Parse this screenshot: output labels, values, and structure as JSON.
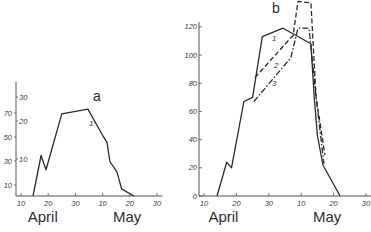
{
  "colors": {
    "ink": "#2b2b2b",
    "axis": "#555555",
    "background": "#ffffff"
  },
  "chart_data": [
    {
      "panel": "a",
      "type": "line",
      "title": "a",
      "xlabel": "",
      "ylabel": "",
      "x_unit": "day counted from April 1 (April 10 = 10, May 10 = 40)",
      "x_ticks": [
        {
          "day": 10,
          "label": "10"
        },
        {
          "day": 20,
          "label": "20"
        },
        {
          "day": 30,
          "label": "30"
        },
        {
          "day": 40,
          "label": "10"
        },
        {
          "day": 50,
          "label": "20"
        },
        {
          "day": 60,
          "label": "30"
        }
      ],
      "month_labels": [
        {
          "label": "April",
          "day": 18
        },
        {
          "label": "May",
          "day": 49
        }
      ],
      "y_ticks_outer": [
        "10",
        "30",
        "50",
        "70"
      ],
      "y_ticks_inner": [
        "10",
        "20",
        "30"
      ],
      "ylim": [
        0,
        80
      ],
      "grid": false,
      "series": [
        {
          "name": "1",
          "style": "solid",
          "points": [
            [
              14.4,
              0
            ],
            [
              17.4,
              34
            ],
            [
              19.2,
              22
            ],
            [
              25,
              69
            ],
            [
              34.6,
              73
            ],
            [
              40,
              51
            ],
            [
              41.6,
              45
            ],
            [
              42.7,
              29
            ],
            [
              45.3,
              20
            ],
            [
              47,
              6
            ],
            [
              51.5,
              0
            ]
          ]
        }
      ]
    },
    {
      "panel": "b",
      "type": "line",
      "title": "b",
      "xlabel": "",
      "ylabel": "",
      "x_unit": "day counted from April 1 (April 10 = 10, May 10 = 40)",
      "x_ticks": [
        {
          "day": 10,
          "label": "10"
        },
        {
          "day": 20,
          "label": "20"
        },
        {
          "day": 30,
          "label": "30"
        },
        {
          "day": 40,
          "label": "10"
        },
        {
          "day": 50,
          "label": "20"
        },
        {
          "day": 60,
          "label": "30"
        }
      ],
      "month_labels": [
        {
          "label": "April",
          "day": 16
        },
        {
          "label": "May",
          "day": 48
        }
      ],
      "y_ticks": [
        "0",
        "20",
        "40",
        "60",
        "80",
        "100",
        "120"
      ],
      "ylim": [
        0,
        140
      ],
      "grid": false,
      "series": [
        {
          "name": "1",
          "style": "solid",
          "points": [
            [
              14,
              0
            ],
            [
              17,
              24
            ],
            [
              18.5,
              20
            ],
            [
              22.3,
              67
            ],
            [
              25,
              70
            ],
            [
              28,
              113
            ],
            [
              34.4,
              119
            ],
            [
              43,
              108
            ],
            [
              44,
              70
            ],
            [
              45,
              43
            ],
            [
              46.7,
              22
            ],
            [
              52,
              0
            ]
          ]
        },
        {
          "name": "2",
          "style": "dashed",
          "points": [
            [
              25.7,
              84
            ],
            [
              37.5,
              114
            ],
            [
              39,
              138
            ],
            [
              43,
              137
            ],
            [
              44.6,
              70
            ],
            [
              47.3,
              29
            ]
          ]
        },
        {
          "name": "3",
          "style": "dash-dot",
          "points": [
            [
              25.4,
              67
            ],
            [
              36.8,
              98
            ],
            [
              39,
              119
            ],
            [
              42.4,
              119
            ],
            [
              44.6,
              70
            ],
            [
              47,
              23
            ]
          ]
        }
      ]
    }
  ]
}
